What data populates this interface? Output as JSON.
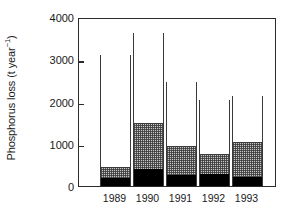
{
  "chart_data": {
    "type": "bar",
    "stacked": true,
    "title": "",
    "xlabel": "",
    "ylabel": "Phosphorus loss (t year-1)",
    "ylabel_main": "Phosphorus loss (t year",
    "ylabel_exponent": "−1",
    "ylabel_close": ")",
    "categories": [
      "1989",
      "1990",
      "1991",
      "1992",
      "1993"
    ],
    "ylim": [
      0,
      4000
    ],
    "yticks": [
      0,
      1000,
      2000,
      3000,
      4000
    ],
    "ytick_labels": [
      "0",
      "1000",
      "2000",
      "3000",
      "4000"
    ],
    "xtick_labels": [
      "1989",
      "1990",
      "1991",
      "1992",
      "1993"
    ],
    "grid": false,
    "legend": false,
    "legend_position": "none",
    "series": [
      {
        "name": "bottom-black",
        "fill": "black",
        "values": [
          190,
          400,
          260,
          280,
          210
        ]
      },
      {
        "name": "middle-hatched",
        "fill": "stippled-grey",
        "values": [
          260,
          1090,
          690,
          480,
          830
        ]
      },
      {
        "name": "top-white",
        "fill": "white",
        "values": [
          2650,
          2130,
          1510,
          1280,
          1090
        ]
      }
    ],
    "cumulative_tops": {
      "bottom": [
        190,
        400,
        260,
        280,
        210
      ],
      "middle": [
        450,
        1490,
        950,
        760,
        1040
      ],
      "total": [
        3100,
        3620,
        2460,
        2040,
        2130
      ]
    },
    "totals": [
      3100,
      3620,
      2460,
      2040,
      2130
    ]
  },
  "colors": {
    "axis": "#2b2b2b",
    "bar_outline": "#3a3a3a",
    "segment_bottom": "#000000",
    "segment_middle": "#c8c8c8",
    "segment_top": "#ffffff",
    "background": "#ffffff",
    "text": "#1a1a1a"
  }
}
